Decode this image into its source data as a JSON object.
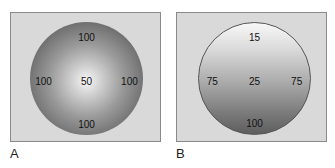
{
  "panels": [
    {
      "label": "A",
      "values": {
        "top": "100",
        "left": "100",
        "center": "50",
        "right": "100",
        "bottom": "100"
      },
      "shading": "radial - bright center, dark edges"
    },
    {
      "label": "B",
      "values": {
        "top": "15",
        "left": "75",
        "center": "25",
        "right": "75",
        "bottom": "100"
      },
      "shading": "vertical - bright top, dark bottom"
    }
  ]
}
